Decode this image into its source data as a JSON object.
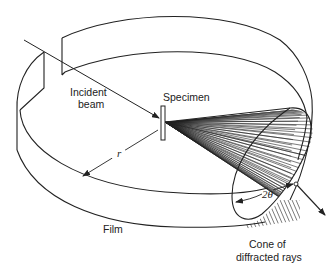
{
  "figure": {
    "labels": {
      "incident_beam_line1": "Incident",
      "incident_beam_line2": "beam",
      "specimen": "Specimen",
      "radius": "r",
      "two_theta": "2θ",
      "film": "Film",
      "cone_line1": "Cone of",
      "cone_line2": "diffracted rays"
    },
    "colors": {
      "stroke": "#222222",
      "background": "#ffffff"
    }
  }
}
